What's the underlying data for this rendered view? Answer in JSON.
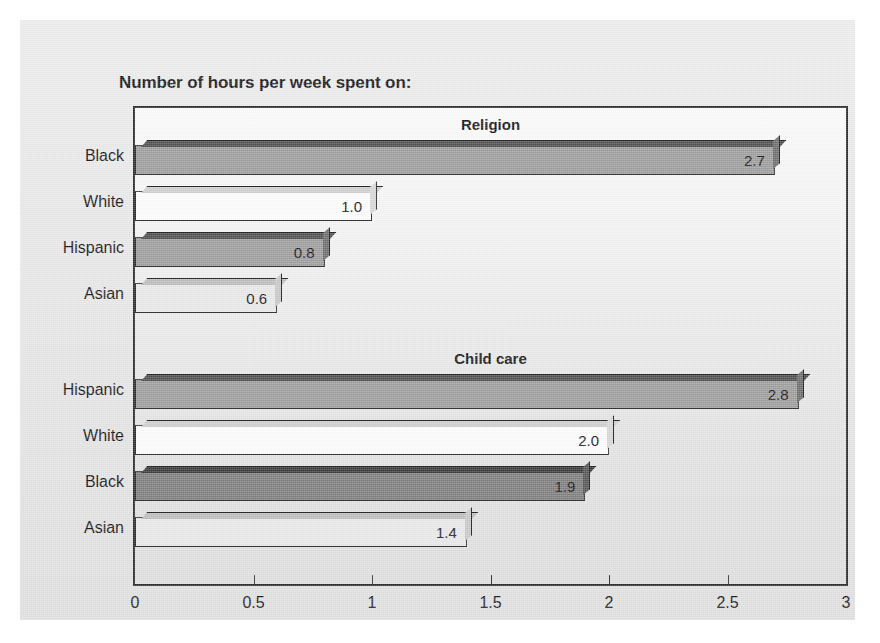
{
  "chart_data": {
    "type": "bar",
    "orientation": "horizontal",
    "title": "Number of hours per week spent on:",
    "xlabel": "",
    "ylabel": "",
    "xlim": [
      0,
      3
    ],
    "xticks": [
      "0",
      "0.5",
      "1",
      "1.5",
      "2",
      "2.5",
      "3"
    ],
    "xtick_values": [
      0,
      0.5,
      1,
      1.5,
      2,
      2.5,
      3
    ],
    "grid": false,
    "legend": "none",
    "groups": [
      {
        "name": "Religion",
        "categories": [
          "Black",
          "White",
          "Hispanic",
          "Asian"
        ],
        "values": [
          2.7,
          1.0,
          0.8,
          0.6
        ],
        "labels": [
          "2.7",
          "1.0",
          "0.8",
          "0.6"
        ],
        "fills": [
          "f-mid",
          "f-white",
          "f-mid",
          "f-light"
        ]
      },
      {
        "name": "Child care",
        "categories": [
          "Hispanic",
          "White",
          "Black",
          "Asian"
        ],
        "values": [
          2.8,
          2.0,
          1.9,
          1.4
        ],
        "labels": [
          "2.8",
          "2.0",
          "1.9",
          "1.4"
        ],
        "fills": [
          "f-mid",
          "f-white",
          "f-dark",
          "f-light"
        ]
      }
    ]
  },
  "colors": {
    "page_background": "#e8e8e8",
    "plot_border": "#2a2a2a",
    "text": "#141414",
    "bar_mid": "#9d9d9d",
    "bar_white": "#fdfdfd",
    "bar_dark": "#7e7e7e",
    "bar_light": "#e8e8e8"
  }
}
